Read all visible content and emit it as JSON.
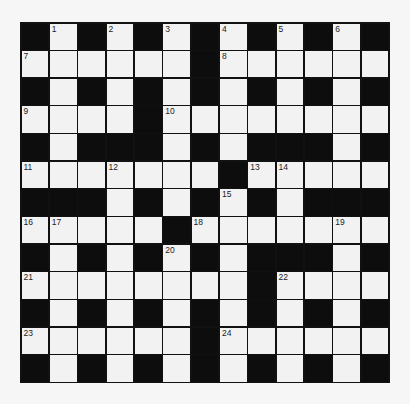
{
  "puzzle": {
    "rows": 13,
    "cols": 13,
    "layout": [
      "#.#.#.#.#.#.#",
      "......#......",
      "#.#.#.#.#.#.#",
      "....#........",
      "#.###.#.###.#",
      ".......#.....",
      "###.#.#.#.###",
      ".....#.......",
      "#.#.#.#.###.#",
      "........#....",
      "#.#.#.#.#.#.#",
      "......#......",
      "#.#.#.#.#.#.#"
    ],
    "numbers": [
      {
        "n": "1",
        "r": 0,
        "c": 1
      },
      {
        "n": "2",
        "r": 0,
        "c": 3
      },
      {
        "n": "3",
        "r": 0,
        "c": 5
      },
      {
        "n": "4",
        "r": 0,
        "c": 7
      },
      {
        "n": "5",
        "r": 0,
        "c": 9
      },
      {
        "n": "6",
        "r": 0,
        "c": 11
      },
      {
        "n": "7",
        "r": 1,
        "c": 0
      },
      {
        "n": "8",
        "r": 1,
        "c": 7
      },
      {
        "n": "9",
        "r": 3,
        "c": 0
      },
      {
        "n": "10",
        "r": 3,
        "c": 5
      },
      {
        "n": "11",
        "r": 5,
        "c": 0
      },
      {
        "n": "12",
        "r": 5,
        "c": 3
      },
      {
        "n": "13",
        "r": 5,
        "c": 8
      },
      {
        "n": "14",
        "r": 5,
        "c": 9
      },
      {
        "n": "15",
        "r": 6,
        "c": 7
      },
      {
        "n": "16",
        "r": 7,
        "c": 0
      },
      {
        "n": "17",
        "r": 7,
        "c": 1
      },
      {
        "n": "18",
        "r": 7,
        "c": 6
      },
      {
        "n": "19",
        "r": 7,
        "c": 11
      },
      {
        "n": "20",
        "r": 8,
        "c": 5
      },
      {
        "n": "21",
        "r": 9,
        "c": 0
      },
      {
        "n": "22",
        "r": 9,
        "c": 9
      },
      {
        "n": "23",
        "r": 11,
        "c": 0
      },
      {
        "n": "24",
        "r": 11,
        "c": 7
      }
    ],
    "colors": {
      "background": "#f6f6f6",
      "black_cell": "#0d0d0d",
      "white_cell": "#f2f2f2",
      "grid_line": "#111111"
    }
  }
}
